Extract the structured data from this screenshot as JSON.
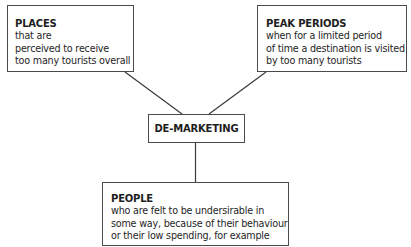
{
  "diagram": {
    "center": {
      "label": "DE-MARKETING"
    },
    "nodes": [
      {
        "id": "places",
        "title": "PLACES",
        "lines": [
          "that are",
          "perceived to receive",
          "too many tourists overall"
        ]
      },
      {
        "id": "peak_periods",
        "title": "PEAK PERIODS",
        "lines": [
          "when for a limited period",
          "of time a destination is visited",
          "by too many tourists"
        ]
      },
      {
        "id": "people",
        "title": "PEOPLE",
        "lines": [
          "who are felt to be undersirable in",
          "some way, because of their behaviour",
          "or their low spending, for example"
        ]
      }
    ],
    "colors": {
      "border": "#4a4a4a",
      "line": "#3a3a3a",
      "text": "#1e1e1e",
      "background": "#ffffff"
    }
  }
}
